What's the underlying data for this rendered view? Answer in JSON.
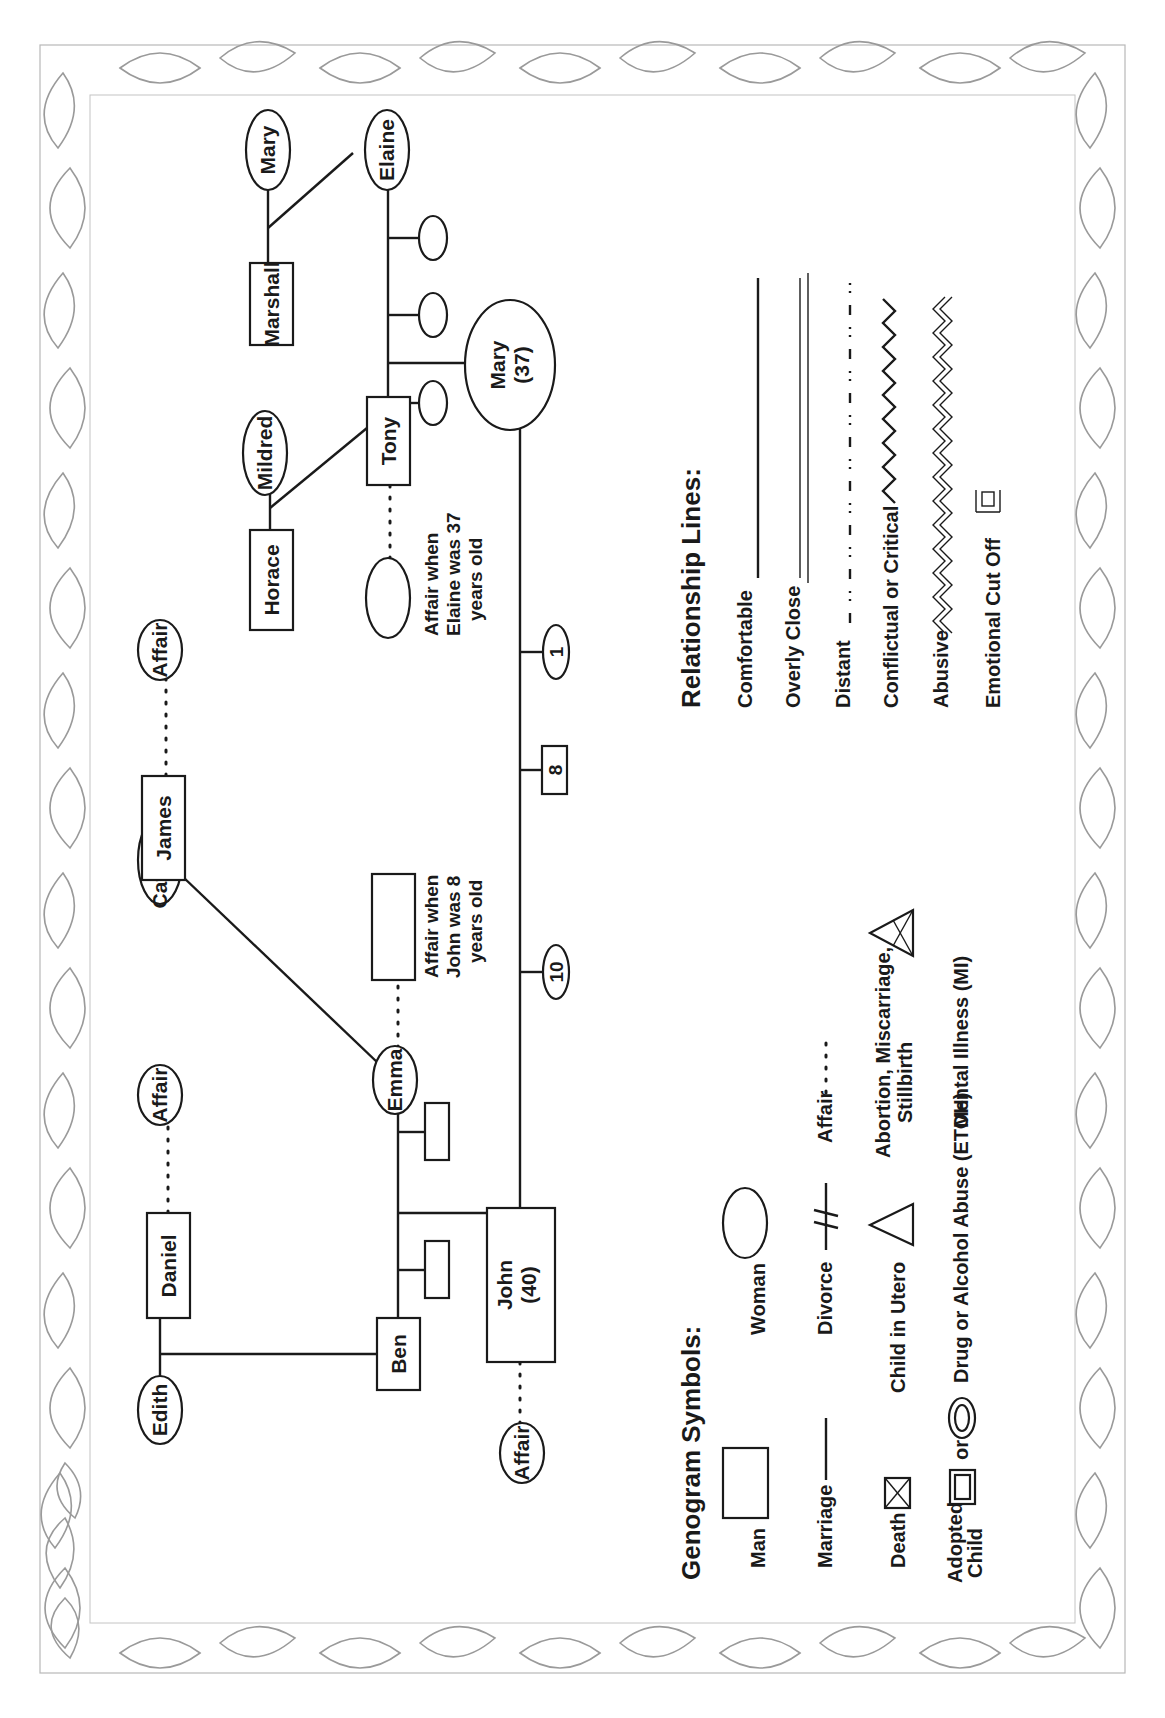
{
  "diagram": {
    "type": "genogram",
    "orientation": "rotated-90-ccw",
    "border": "floral lily border"
  },
  "people": {
    "edith": {
      "name": "Edith",
      "gender": "female"
    },
    "daniel": {
      "name": "Daniel",
      "gender": "male"
    },
    "affair_daniel": {
      "name": "Affair",
      "gender": "female"
    },
    "ben": {
      "name": "Ben",
      "gender": "male"
    },
    "catherine": {
      "name": "Catherine",
      "gender": "female"
    },
    "james": {
      "name": "James",
      "gender": "male"
    },
    "affair_james": {
      "name": "Affair",
      "gender": "female"
    },
    "emma": {
      "name": "Emma",
      "gender": "female"
    },
    "affair_emma": {
      "gender": "male",
      "note_line1": "Affair when",
      "note_line2": "John was 8",
      "note_line3": "years old"
    },
    "john": {
      "name": "John",
      "age": "(40)",
      "gender": "male"
    },
    "affair_john": {
      "name": "Affair",
      "gender": "female"
    },
    "horace": {
      "name": "Horace",
      "gender": "male"
    },
    "mildred": {
      "name": "Mildred",
      "gender": "female"
    },
    "tony": {
      "name": "Tony",
      "gender": "male"
    },
    "affair_tony": {
      "gender": "female",
      "note_line1": "Affair when",
      "note_line2": "Elaine was 37",
      "note_line3": "years old"
    },
    "marshall": {
      "name": "Marshall",
      "gender": "male"
    },
    "mary_elder": {
      "name": "Mary",
      "gender": "female"
    },
    "elaine": {
      "name": "Elaine",
      "gender": "female"
    },
    "mary": {
      "name": "Mary",
      "age": "(37)",
      "gender": "female"
    }
  },
  "children_of_john_mary": [
    {
      "label": "10",
      "gender": "female"
    },
    {
      "label": "8",
      "gender": "male"
    },
    {
      "label": "1",
      "gender": "female"
    }
  ],
  "relationships": [
    {
      "type": "marriage",
      "between": [
        "Edith",
        "Daniel"
      ],
      "children": [
        "Ben"
      ]
    },
    {
      "type": "affair",
      "between": [
        "Daniel",
        "Affair"
      ]
    },
    {
      "type": "marriage",
      "between": [
        "Catherine",
        "James"
      ],
      "children": [
        "Emma"
      ]
    },
    {
      "type": "affair",
      "between": [
        "James",
        "Affair"
      ]
    },
    {
      "type": "marriage",
      "between": [
        "Ben",
        "Emma"
      ],
      "children": [
        "son",
        "John (40)",
        "son"
      ]
    },
    {
      "type": "affair",
      "between": [
        "Emma",
        "Man (affair when John was 8 years old)"
      ]
    },
    {
      "type": "affair",
      "between": [
        "John",
        "Affair"
      ]
    },
    {
      "type": "marriage",
      "between": [
        "Horace",
        "Mildred"
      ],
      "children": [
        "Tony"
      ]
    },
    {
      "type": "marriage",
      "between": [
        "Marshall",
        "Mary"
      ],
      "children": [
        "Elaine"
      ]
    },
    {
      "type": "marriage",
      "between": [
        "Tony",
        "Elaine"
      ],
      "children": [
        "daughter",
        "Mary (37)",
        "daughter",
        "daughter"
      ]
    },
    {
      "type": "affair",
      "between": [
        "Tony",
        "Woman (affair when Elaine was 37 years old)"
      ]
    },
    {
      "type": "marriage",
      "between": [
        "John",
        "Mary"
      ],
      "children": [
        "10",
        "8",
        "1"
      ]
    }
  ],
  "legend_symbols": {
    "title": "Genogram Symbols:",
    "man": "Man",
    "woman": "Woman",
    "marriage": "Marriage",
    "divorce": "Divorce",
    "affair": "Affair",
    "death": "Death",
    "child_in_utero": "Child in Utero",
    "abortion_line1": "Abortion, Miscarriage,",
    "abortion_line2": "Stillbirth",
    "adopted_line1": "Adopted",
    "adopted_line2": "Child",
    "or": "or",
    "drug": "Drug or Alcohol Abuse (ETOH)",
    "mental": "Mental Illness (MI)"
  },
  "legend_lines": {
    "title": "Relationship Lines:",
    "comfortable": "Comfortable",
    "overly_close": "Overly Close",
    "distant": "Distant",
    "conflictual": "Conflictual or Critical",
    "abusive": "Abusive",
    "cutoff": "Emotional Cut Off"
  },
  "colors": {
    "ink": "#1a1a1a",
    "border": "#9a9a9a",
    "background": "#ffffff"
  }
}
